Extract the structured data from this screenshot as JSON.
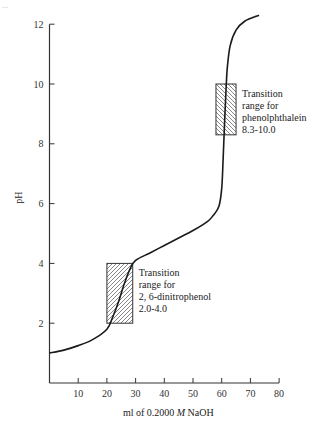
{
  "page_mark": "...",
  "chart_data": {
    "type": "line",
    "title": "",
    "xlabel": "ml of 0.2000 M NaOH",
    "xlabel_parts": {
      "pre": "ml of 0.2000 ",
      "italic": "M",
      "post": " NaOH"
    },
    "ylabel": "pH",
    "xlim": [
      0,
      80
    ],
    "ylim": [
      0,
      12
    ],
    "x_ticks": [
      10,
      20,
      30,
      40,
      50,
      60,
      70,
      80
    ],
    "y_ticks": [
      2,
      4,
      6,
      8,
      10,
      12
    ],
    "grid": false,
    "series": [
      {
        "name": "Titration curve",
        "x": [
          0,
          5,
          10,
          15,
          20,
          22,
          24,
          26,
          28,
          30,
          35,
          40,
          45,
          50,
          55,
          57,
          59,
          60,
          60.5,
          61,
          61.5,
          62,
          63,
          65,
          68,
          73
        ],
        "y": [
          1.0,
          1.1,
          1.25,
          1.45,
          1.8,
          2.2,
          2.7,
          3.3,
          3.8,
          4.1,
          4.35,
          4.6,
          4.85,
          5.1,
          5.4,
          5.6,
          5.9,
          6.5,
          7.5,
          8.7,
          9.8,
          10.6,
          11.3,
          11.8,
          12.1,
          12.3
        ]
      }
    ],
    "annotations": [
      {
        "name": "phenolphthalein",
        "type": "hatched-box",
        "x_range": [
          58,
          65
        ],
        "y_range": [
          8.3,
          10.0
        ],
        "hatch": "backslash",
        "label_lines": [
          "Transition",
          "range for",
          "phenolphthalein",
          "8.3-10.0"
        ]
      },
      {
        "name": "2,6-dinitrophenol",
        "type": "hatched-box",
        "x_range": [
          20,
          29
        ],
        "y_range": [
          2.0,
          4.0
        ],
        "hatch": "slash",
        "label_lines": [
          "Transition",
          "range for",
          "2, 6-dinitrophenol",
          "2.0-4.0"
        ]
      }
    ],
    "legend": null
  },
  "colors": {
    "line": "#1a1a1a",
    "axis": "#333333",
    "hatch": "#555555"
  }
}
